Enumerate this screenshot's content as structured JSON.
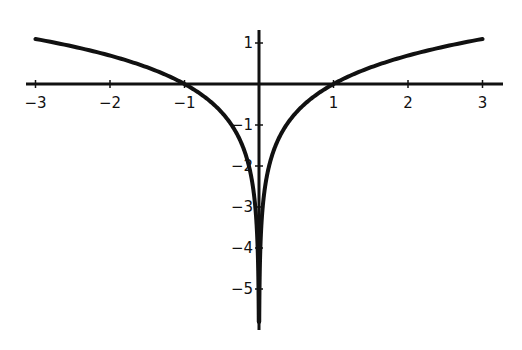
{
  "chart_data": {
    "type": "line",
    "title": "",
    "xlabel": "",
    "ylabel": "",
    "function": "y = ln|x|",
    "xlim": [
      -3,
      3
    ],
    "ylim": [
      -5.8,
      1.1
    ],
    "grid": false,
    "legend": null,
    "x_ticks": [
      "-3",
      "-2",
      "-1",
      "1",
      "2",
      "3"
    ],
    "y_ticks": [
      "1",
      "-1",
      "-2",
      "-3",
      "-4",
      "-5"
    ],
    "series": [
      {
        "name": "ln|x|",
        "x": [
          -3,
          -2.5,
          -2,
          -1.5,
          -1,
          -0.75,
          -0.5,
          -0.25,
          -0.1,
          -0.05,
          -0.02,
          -0.01,
          -0.005,
          -0.003,
          0.003,
          0.005,
          0.01,
          0.02,
          0.05,
          0.1,
          0.25,
          0.5,
          0.75,
          1,
          1.5,
          2,
          2.5,
          3
        ],
        "y": [
          1.099,
          0.916,
          0.693,
          0.405,
          0,
          -0.288,
          -0.693,
          -1.386,
          -2.303,
          -2.996,
          -3.912,
          -4.605,
          -5.298,
          -5.809,
          -5.809,
          -5.298,
          -4.605,
          -3.912,
          -2.996,
          -2.303,
          -1.386,
          -0.693,
          -0.288,
          0,
          0.405,
          0.693,
          0.916,
          1.099
        ]
      }
    ],
    "colors": {
      "curve": "#111111",
      "axes": "#111111",
      "background": "#ffffff"
    }
  }
}
